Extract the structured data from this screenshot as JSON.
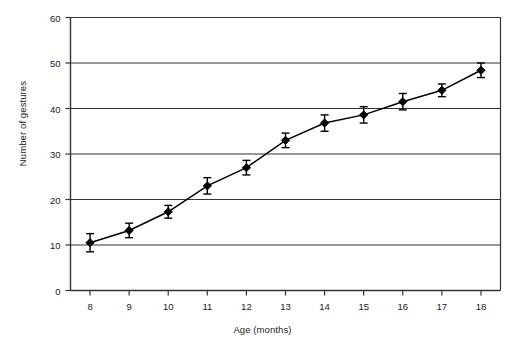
{
  "chart_data": {
    "type": "line",
    "title": "",
    "xlabel": "Age (months)",
    "ylabel": "Number of gestures",
    "x": [
      8,
      9,
      10,
      11,
      12,
      13,
      14,
      15,
      16,
      17,
      18
    ],
    "xtick_labels": [
      "8",
      "9",
      "10",
      "11",
      "12",
      "13",
      "14",
      "15",
      "16",
      "17",
      "18"
    ],
    "ytick_labels": [
      "0",
      "10",
      "20",
      "30",
      "40",
      "50",
      "60"
    ],
    "yticks": [
      0,
      10,
      20,
      30,
      40,
      50,
      60
    ],
    "xlim": [
      7.5,
      18.5
    ],
    "ylim": [
      0,
      60
    ],
    "grid": "horizontal",
    "legend": "none",
    "marker": "diamond",
    "error_bars": true,
    "series": [
      {
        "name": "Number of gestures",
        "values": [
          10.5,
          13.2,
          17.3,
          23.0,
          27.0,
          33.0,
          36.8,
          38.6,
          41.5,
          44.0,
          48.4
        ],
        "errors": [
          2.0,
          1.6,
          1.4,
          1.8,
          1.6,
          1.6,
          1.8,
          1.8,
          1.8,
          1.4,
          1.6
        ],
        "color": "#000000"
      }
    ]
  }
}
